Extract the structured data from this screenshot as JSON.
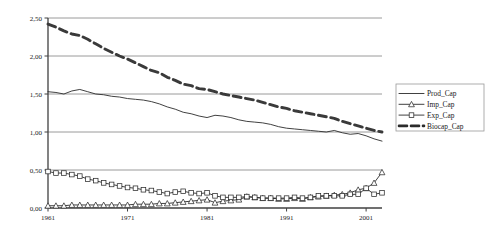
{
  "chart_data": {
    "type": "line",
    "title": "",
    "xlabel": "",
    "ylabel": "",
    "xlim": [
      1961,
      2003
    ],
    "ylim": [
      0,
      2.5
    ],
    "grid": true,
    "legend_position": "right",
    "decimal_separator": ",",
    "y_ticks": [
      "0,00",
      "0,50",
      "1,00",
      "1,50",
      "2,00",
      "2,50"
    ],
    "y_tick_values": [
      0,
      0.5,
      1.0,
      1.5,
      2.0,
      2.5
    ],
    "x_ticks": [
      "1961",
      "1971",
      "1981",
      "1991",
      "2001"
    ],
    "x_tick_values": [
      1961,
      1971,
      1981,
      1991,
      2001
    ],
    "x": [
      1961,
      1962,
      1963,
      1964,
      1965,
      1966,
      1967,
      1968,
      1969,
      1970,
      1971,
      1972,
      1973,
      1974,
      1975,
      1976,
      1977,
      1978,
      1979,
      1980,
      1981,
      1982,
      1983,
      1984,
      1985,
      1986,
      1987,
      1988,
      1989,
      1990,
      1991,
      1992,
      1993,
      1994,
      1995,
      1996,
      1997,
      1998,
      1999,
      2000,
      2001,
      2002,
      2003
    ],
    "series": [
      {
        "name": "Prod_Cap",
        "style": "solid-thin",
        "marker": "none",
        "color": "#2b2b2b",
        "values": [
          1.53,
          1.52,
          1.5,
          1.54,
          1.56,
          1.53,
          1.5,
          1.49,
          1.47,
          1.46,
          1.44,
          1.43,
          1.42,
          1.4,
          1.37,
          1.33,
          1.3,
          1.26,
          1.24,
          1.21,
          1.19,
          1.22,
          1.21,
          1.19,
          1.16,
          1.14,
          1.13,
          1.12,
          1.1,
          1.07,
          1.05,
          1.04,
          1.03,
          1.02,
          1.01,
          1.0,
          1.02,
          0.99,
          0.97,
          0.98,
          0.95,
          0.91,
          0.88
        ]
      },
      {
        "name": "Imp_Cap",
        "style": "solid-thin",
        "marker": "triangle",
        "color": "#2b2b2b",
        "values": [
          0.03,
          0.03,
          0.03,
          0.04,
          0.04,
          0.04,
          0.04,
          0.04,
          0.04,
          0.04,
          0.04,
          0.05,
          0.05,
          0.05,
          0.06,
          0.06,
          0.07,
          0.08,
          0.09,
          0.1,
          0.11,
          0.07,
          0.09,
          0.1,
          0.11,
          0.15,
          0.14,
          0.13,
          0.13,
          0.12,
          0.12,
          0.13,
          0.12,
          0.14,
          0.15,
          0.16,
          0.17,
          0.18,
          0.2,
          0.24,
          0.26,
          0.33,
          0.47
        ]
      },
      {
        "name": "Exp_Cap",
        "style": "solid-thin",
        "marker": "square",
        "color": "#2b2b2b",
        "values": [
          0.48,
          0.46,
          0.46,
          0.44,
          0.42,
          0.38,
          0.36,
          0.33,
          0.31,
          0.29,
          0.27,
          0.26,
          0.24,
          0.23,
          0.21,
          0.19,
          0.21,
          0.22,
          0.2,
          0.19,
          0.2,
          0.16,
          0.14,
          0.14,
          0.14,
          0.15,
          0.14,
          0.13,
          0.13,
          0.13,
          0.13,
          0.14,
          0.13,
          0.14,
          0.16,
          0.16,
          0.16,
          0.16,
          0.18,
          0.18,
          0.26,
          0.18,
          0.2
        ]
      },
      {
        "name": "Biocap_Cap",
        "style": "dashed-thick",
        "marker": "none",
        "color": "#3a3a3a",
        "values": [
          2.42,
          2.38,
          2.33,
          2.29,
          2.27,
          2.22,
          2.16,
          2.1,
          2.05,
          2.0,
          1.96,
          1.91,
          1.86,
          1.81,
          1.78,
          1.72,
          1.68,
          1.63,
          1.61,
          1.57,
          1.56,
          1.53,
          1.5,
          1.48,
          1.46,
          1.44,
          1.42,
          1.39,
          1.36,
          1.33,
          1.31,
          1.28,
          1.26,
          1.24,
          1.22,
          1.2,
          1.18,
          1.14,
          1.11,
          1.08,
          1.05,
          1.02,
          1.0
        ]
      }
    ]
  },
  "legend": {
    "items": [
      {
        "label": "Prod_Cap",
        "marker": "none",
        "style": "solid-thin"
      },
      {
        "label": "Imp_Cap",
        "marker": "triangle",
        "style": "solid-thin"
      },
      {
        "label": "Exp_Cap",
        "marker": "square",
        "style": "solid-thin"
      },
      {
        "label": "Biocap_Cap",
        "marker": "none",
        "style": "dashed-thick"
      }
    ]
  },
  "colors": {
    "axis": "#404040",
    "grid": "#808080",
    "text": "#1a1a1a",
    "series": "#2b2b2b",
    "background": "#ffffff",
    "legend_border": "#9a9a9a"
  }
}
